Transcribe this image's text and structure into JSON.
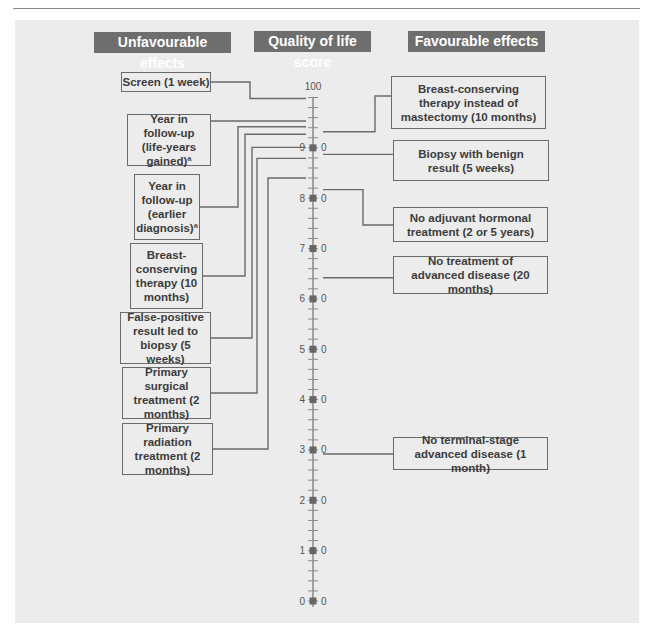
{
  "headers": {
    "unfavourable": "Unfavourable effects",
    "scale": "Quality of life score",
    "favourable": "Favourable effects"
  },
  "scale": {
    "min": 0,
    "max": 100,
    "labels_left": [
      "100",
      "9",
      "8",
      "7",
      "6",
      "5",
      "4",
      "3",
      "2",
      "1",
      "0"
    ],
    "labels_right": [
      "0",
      "0",
      "0",
      "0",
      "0",
      "0",
      "0",
      "0",
      "0",
      "0"
    ]
  },
  "unfavourable_effects": [
    {
      "label": "Screen (1 week)",
      "score": 99.8
    },
    {
      "label": "Year in follow-up (life-years gained)ª",
      "score": 95.6
    },
    {
      "label": "Year in follow-up (earlier diagnosis)ª",
      "score": 94.2
    },
    {
      "label": "Breast-conserving therapy (10 months)",
      "score": 92.7
    },
    {
      "label": "False-positive result led to biopsy (5 weeks)",
      "score": 90.1
    },
    {
      "label": "Primary surgical treatment (2 months)",
      "score": 87.9
    },
    {
      "label": "Primary radiation treatment (2 months)",
      "score": 84.0
    }
  ],
  "favourable_effects": [
    {
      "label": "Breast-conserving therapy instead of mastectomy (10 months)",
      "score": 93.2
    },
    {
      "label": "Biopsy with benign result (5 weeks)",
      "score": 88.7
    },
    {
      "label": "No adjuvant hormonal treatment (2 or 5 years)",
      "score": 81.7
    },
    {
      "label": "No treatment of advanced disease (20 months)",
      "score": 64.2
    },
    {
      "label": "No terminal-stage advanced disease (1 month)",
      "score": 29.2
    }
  ],
  "colors": {
    "header_bg": "#6e6e6e",
    "panel_bg": "#ececec",
    "line": "#6a6a6a",
    "text": "#3c3c3c"
  }
}
